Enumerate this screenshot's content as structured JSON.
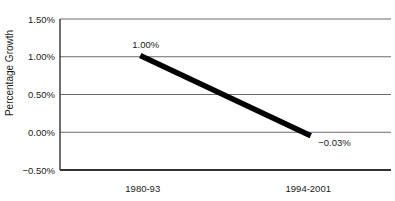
{
  "chart_data": {
    "type": "line",
    "title": "",
    "xlabel": "",
    "ylabel": "Percentage Growth",
    "categories": [
      "1980-93",
      "1994-2001"
    ],
    "series": [
      {
        "name": "Percentage Growth",
        "values": [
          1.0,
          -0.03
        ]
      }
    ],
    "data_labels": [
      "1.00%",
      "−0.03%"
    ],
    "y_ticks": [
      {
        "value": 1.5,
        "label": "1.50%"
      },
      {
        "value": 1.0,
        "label": "1.00%"
      },
      {
        "value": 0.5,
        "label": "0.50%"
      },
      {
        "value": 0.0,
        "label": "0.00%"
      },
      {
        "value": -0.5,
        "label": "−0.50%"
      }
    ],
    "ylim": [
      -0.5,
      1.5
    ],
    "grid": "horizontal",
    "legend": "none",
    "style": {
      "line_color": "#000000",
      "line_width_px": 5.5,
      "gridline_color": "#6b6b6b",
      "axis_color": "#333333",
      "text_color": "#1a1a1a",
      "background": "#ffffff"
    }
  }
}
